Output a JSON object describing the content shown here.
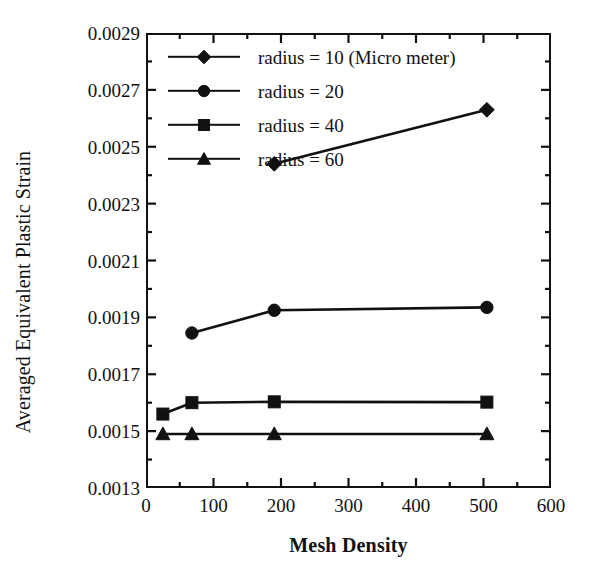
{
  "chart_data": {
    "type": "line",
    "title": "",
    "xlabel": "Mesh Density",
    "ylabel": "Averaged Equivalent Plastic Strain",
    "xlim": [
      0,
      600
    ],
    "ylim": [
      0.0013,
      0.0029
    ],
    "xticks": [
      0,
      100,
      200,
      300,
      400,
      500,
      600
    ],
    "xtick_labels": [
      "0",
      "100",
      "200",
      "300",
      "400",
      "500",
      "600"
    ],
    "xminor_ticks": [
      50,
      150,
      250,
      350,
      450,
      550
    ],
    "yticks": [
      0.0013,
      0.0015,
      0.0017,
      0.0019,
      0.0021,
      0.0023,
      0.0025,
      0.0027,
      0.0029
    ],
    "ytick_labels": [
      "0.0013",
      "0.0015",
      "0.0017",
      "0.0019",
      "0.0021",
      "0.0023",
      "0.0025",
      "0.0027",
      "0.0029"
    ],
    "yminor_ticks": [
      0.0014,
      0.0016,
      0.0018,
      0.002,
      0.0022,
      0.0024,
      0.0026,
      0.0028
    ],
    "grid": false,
    "legend_position": "upper left",
    "line_color": "#111111",
    "series": [
      {
        "name": "radius = 10 (Micro meter)",
        "marker": "diamond",
        "color": "#111111",
        "x": [
          190,
          505
        ],
        "values": [
          0.00244,
          0.00263
        ]
      },
      {
        "name": "radius = 20",
        "marker": "circle",
        "color": "#111111",
        "x": [
          68,
          190,
          505
        ],
        "values": [
          0.001845,
          0.001925,
          0.001935
        ]
      },
      {
        "name": "radius = 40",
        "marker": "square",
        "color": "#111111",
        "x": [
          25,
          68,
          190,
          505
        ],
        "values": [
          0.00156,
          0.0016,
          0.001603,
          0.001602
        ]
      },
      {
        "name": "radius = 60",
        "marker": "triangle",
        "color": "#111111",
        "x": [
          25,
          68,
          190,
          505
        ],
        "values": [
          0.00149,
          0.00149,
          0.00149,
          0.00149
        ]
      }
    ]
  },
  "legend": {
    "entries": [
      "radius = 10 (Micro meter)",
      "radius = 20",
      "radius = 40",
      "radius = 60"
    ]
  }
}
